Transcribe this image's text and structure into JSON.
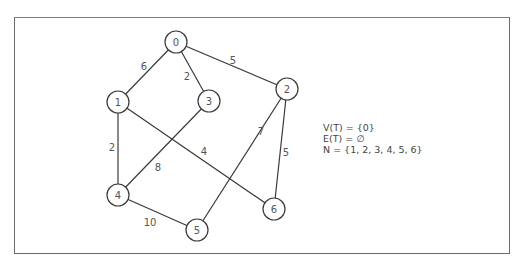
{
  "graph": {
    "nodes": [
      {
        "id": "0",
        "label": "0",
        "x": 176,
        "y": 42
      },
      {
        "id": "1",
        "label": "1",
        "x": 118,
        "y": 102
      },
      {
        "id": "2",
        "label": "2",
        "x": 287,
        "y": 89
      },
      {
        "id": "3",
        "label": "3",
        "x": 209,
        "y": 101
      },
      {
        "id": "4",
        "label": "4",
        "x": 118,
        "y": 195
      },
      {
        "id": "5",
        "label": "5",
        "x": 197,
        "y": 230
      },
      {
        "id": "6",
        "label": "6",
        "x": 274,
        "y": 209
      }
    ],
    "edges": [
      {
        "from": "0",
        "to": "1",
        "weight": "6",
        "lx": 144,
        "ly": 66
      },
      {
        "from": "0",
        "to": "3",
        "weight": "2",
        "lx": 187,
        "ly": 76
      },
      {
        "from": "0",
        "to": "2",
        "weight": "5",
        "lx": 233,
        "ly": 60
      },
      {
        "from": "1",
        "to": "4",
        "weight": "2",
        "lx": 112,
        "ly": 147
      },
      {
        "from": "1",
        "to": "6",
        "weight": "4",
        "lx": 204,
        "ly": 151
      },
      {
        "from": "3",
        "to": "4",
        "weight": "8",
        "lx": 158,
        "ly": 167
      },
      {
        "from": "2",
        "to": "5",
        "weight": "7",
        "lx": 261,
        "ly": 131
      },
      {
        "from": "2",
        "to": "6",
        "weight": "5",
        "lx": 286,
        "ly": 152
      },
      {
        "from": "4",
        "to": "5",
        "weight": "10",
        "lx": 150,
        "ly": 222
      }
    ]
  },
  "info": {
    "vertex_set": "V(T) = {0}",
    "edge_set": "E(T) = ∅",
    "remaining_set": "N = {1, 2, 3, 4, 5, 6}"
  }
}
